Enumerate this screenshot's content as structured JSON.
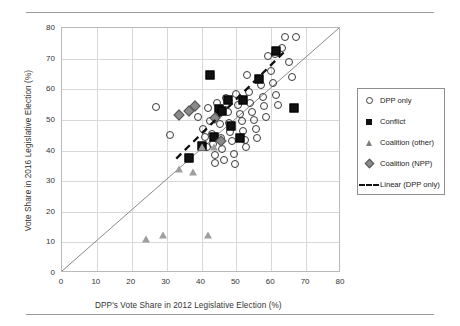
{
  "figure": {
    "name": "scatter-plot-dpp-vote-share"
  },
  "chart_data": {
    "type": "scatter",
    "title": "",
    "xlabel": "DPP's Vote Share in 2012 Legislative Election (%)",
    "ylabel": "Vote Share in 2016 Legislative Election (%)",
    "xlim": [
      0,
      80
    ],
    "ylim": [
      0,
      80
    ],
    "xticks": [
      0,
      10,
      20,
      30,
      40,
      50,
      60,
      70,
      80
    ],
    "yticks": [
      0,
      10,
      20,
      30,
      40,
      50,
      60,
      70,
      80
    ],
    "grid": true,
    "legend_position": "right",
    "reference_line": {
      "name": "45-degree line",
      "from": [
        0,
        0
      ],
      "to": [
        80,
        80
      ],
      "style": "solid",
      "color": "#8a8a8a"
    },
    "trend_line": {
      "name": "Linear (DPP only)",
      "from": [
        33,
        37
      ],
      "to": [
        64.5,
        72.5
      ],
      "style": "dashed",
      "color": "#111111"
    },
    "series": [
      {
        "name": "DPP only",
        "marker": "circle",
        "color": "#3a3a3a",
        "points": [
          [
            27.0,
            54.2
          ],
          [
            31.0,
            45.0
          ],
          [
            39.0,
            51.0
          ],
          [
            40.5,
            47.0
          ],
          [
            41.0,
            44.5
          ],
          [
            41.5,
            41.0
          ],
          [
            42.0,
            53.8
          ],
          [
            42.5,
            49.5
          ],
          [
            43.0,
            45.5
          ],
          [
            43.2,
            42.0
          ],
          [
            43.8,
            38.5
          ],
          [
            44.0,
            36.0
          ],
          [
            44.5,
            55.5
          ],
          [
            45.0,
            52.0
          ],
          [
            45.2,
            48.5
          ],
          [
            45.5,
            44.0
          ],
          [
            46.0,
            40.5
          ],
          [
            46.5,
            37.0
          ],
          [
            47.0,
            57.0
          ],
          [
            47.5,
            52.5
          ],
          [
            48.0,
            49.0
          ],
          [
            48.3,
            46.0
          ],
          [
            48.8,
            43.0
          ],
          [
            49.2,
            39.0
          ],
          [
            49.5,
            35.5
          ],
          [
            50.0,
            58.5
          ],
          [
            50.5,
            55.0
          ],
          [
            51.0,
            52.0
          ],
          [
            51.5,
            49.5
          ],
          [
            52.0,
            46.5
          ],
          [
            52.5,
            43.5
          ],
          [
            52.8,
            41.0
          ],
          [
            53.0,
            64.5
          ],
          [
            53.5,
            59.0
          ],
          [
            54.0,
            55.5
          ],
          [
            54.5,
            52.5
          ],
          [
            55.0,
            50.0
          ],
          [
            55.5,
            47.0
          ],
          [
            56.0,
            44.0
          ],
          [
            57.0,
            61.5
          ],
          [
            57.5,
            57.5
          ],
          [
            58.0,
            54.5
          ],
          [
            58.5,
            51.0
          ],
          [
            59.0,
            71.0
          ],
          [
            60.0,
            66.0
          ],
          [
            60.5,
            62.0
          ],
          [
            61.0,
            71.5
          ],
          [
            61.5,
            58.0
          ],
          [
            62.0,
            55.0
          ],
          [
            63.0,
            73.5
          ],
          [
            64.0,
            77.0
          ],
          [
            67.0,
            77.0
          ],
          [
            65.0,
            69.0
          ],
          [
            66.0,
            64.0
          ]
        ]
      },
      {
        "name": "Conflict",
        "marker": "square",
        "color": "#111111",
        "points": [
          [
            36.5,
            37.5
          ],
          [
            40.0,
            41.5
          ],
          [
            42.5,
            64.5
          ],
          [
            45.0,
            53.5
          ],
          [
            46.0,
            53.0
          ],
          [
            47.5,
            56.5
          ],
          [
            48.5,
            48.0
          ],
          [
            51.0,
            44.0
          ],
          [
            52.0,
            56.5
          ],
          [
            56.5,
            63.5
          ],
          [
            61.5,
            72.5
          ],
          [
            66.5,
            54.0
          ],
          [
            43.5,
            44.5
          ]
        ]
      },
      {
        "name": "Coalition (other)",
        "marker": "triangle",
        "color": "#9e9e9e",
        "points": [
          [
            24.0,
            11.0
          ],
          [
            29.0,
            12.5
          ],
          [
            42.0,
            12.5
          ],
          [
            33.5,
            34.0
          ],
          [
            37.5,
            33.0
          ],
          [
            40.0,
            41.0
          ],
          [
            43.5,
            41.0
          ]
        ]
      },
      {
        "name": "Coalition (NPP)",
        "marker": "diamond",
        "color": "#8a8a8a",
        "points": [
          [
            33.5,
            51.5
          ],
          [
            36.5,
            53.0
          ],
          [
            38.0,
            54.5
          ],
          [
            44.0,
            50.5
          ],
          [
            45.5,
            43.0
          ]
        ]
      }
    ]
  },
  "legend": {
    "items": [
      {
        "label": "DPP only",
        "symbol": "circle-marker-icon"
      },
      {
        "label": "Conflict",
        "symbol": "square-marker-icon"
      },
      {
        "label": "Coalition (other)",
        "symbol": "triangle-marker-icon"
      },
      {
        "label": "Coalition (NPP)",
        "symbol": "diamond-marker-icon"
      },
      {
        "label": "Linear (DPP only)",
        "symbol": "dashed-line-icon"
      }
    ]
  }
}
